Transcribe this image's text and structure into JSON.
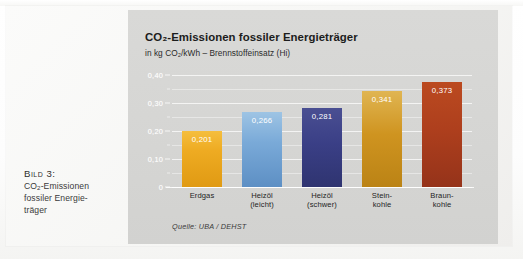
{
  "caption": {
    "head": "Bild 3:",
    "line1_pre": "CO",
    "line1_sub": "2",
    "line1_post": "-Emissionen",
    "line2": "fossiler Energie-",
    "line3": "träger"
  },
  "chart_header": {
    "title": "CO₂-Emissionen fossiler Energieträger",
    "subtitle": "in kg CO₂/kWh – Brennstoffeinsatz (Hi)"
  },
  "source": "Quelle: UBA / DEHST",
  "colors": {
    "panel_bg": "#d6d6d4",
    "page_bg": "#f7f7f5",
    "gridline": "#ffffff",
    "erdgas": "#eeaa22",
    "heizoel_leicht": "#6ea3d4",
    "heizoel_schwer": "#3a3f86",
    "steinkohle": "#cf9420",
    "braunkohle": "#b0401d"
  },
  "chart_data": {
    "type": "bar",
    "title": "CO₂-Emissionen fossiler Energieträger",
    "subtitle": "in kg CO₂/kWh – Brennstoffeinsatz (Hi)",
    "xlabel": "",
    "ylabel": "kg CO2/kWh",
    "ylim": [
      0,
      0.42
    ],
    "grid": true,
    "legend": "none",
    "source": "Quelle: UBA / DEHST",
    "y_ticks": [
      "0",
      "0,10",
      "0,20",
      "0,30",
      "0,40"
    ],
    "y_tick_values": [
      0,
      0.1,
      0.2,
      0.3,
      0.4
    ],
    "y_minor_values": [
      0.05,
      0.15,
      0.25,
      0.35
    ],
    "categories": [
      "Erdgas",
      "Heizöl (leicht)",
      "Heizöl (schwer)",
      "Stein-kohle",
      "Braun-kohle"
    ],
    "category_lines": [
      [
        "Erdgas"
      ],
      [
        "Heizöl",
        "(leicht)"
      ],
      [
        "Heizöl",
        "(schwer)"
      ],
      [
        "Stein-",
        "kohle"
      ],
      [
        "Braun-",
        "kohle"
      ]
    ],
    "values": [
      0.201,
      0.266,
      0.281,
      0.341,
      0.373
    ],
    "value_labels": [
      "0,201",
      "0,266",
      "0,281",
      "0,341",
      "0,373"
    ],
    "bar_colors": [
      "#eeaa22",
      "#6ea3d4",
      "#3a3f86",
      "#cf9420",
      "#b0401d"
    ]
  }
}
